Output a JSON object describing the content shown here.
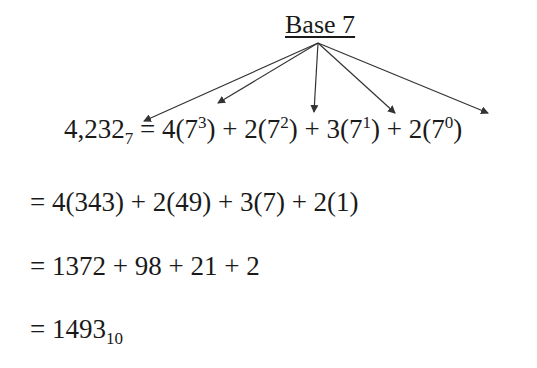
{
  "title": "Base 7",
  "main_equation": {
    "number": "4,232",
    "number_base": "7",
    "equals": " = ",
    "terms": [
      {
        "coef": "4",
        "base": "7",
        "exp": "3",
        "sep": " + "
      },
      {
        "coef": "2",
        "base": "7",
        "exp": "2",
        "sep": " + "
      },
      {
        "coef": "3",
        "base": "7",
        "exp": "1",
        "sep": " + "
      },
      {
        "coef": "2",
        "base": "7",
        "exp": "0",
        "sep": ""
      }
    ]
  },
  "steps": [
    {
      "text": "= 4(343) + 2(49) + 3(7) + 2(1)"
    },
    {
      "text": "= 1372 + 98 + 21 + 2"
    },
    {
      "result": "= 1493",
      "result_base": "10"
    }
  ],
  "arrows": {
    "origin": [
      318,
      43
    ],
    "targets": [
      [
        144,
        121
      ],
      [
        218,
        103
      ],
      [
        314,
        112
      ],
      [
        395,
        113
      ],
      [
        488,
        113
      ]
    ],
    "color": "#333333"
  }
}
